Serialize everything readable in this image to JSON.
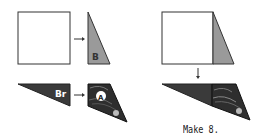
{
  "diagram": {
    "type": "folding-instructions",
    "colors": {
      "outline": "#333333",
      "paper_white": "#ffffff",
      "gray_fill": "#9a9a9a",
      "dark_fill": "#3a3a3a",
      "label_text": "#ffffff"
    },
    "panels": [
      {
        "id": "square-top-left",
        "shape": "square"
      },
      {
        "id": "triangle-b",
        "shape": "right-triangle",
        "label": "B"
      },
      {
        "id": "triangle-br",
        "shape": "wide-triangle",
        "label": "Br"
      },
      {
        "id": "triangle-a",
        "shape": "trapezoid-image",
        "label": "A"
      },
      {
        "id": "square-combined",
        "shape": "square-with-triangle"
      },
      {
        "id": "combined-bottom",
        "shape": "long-triangle-with-image"
      }
    ],
    "labels": {
      "b": "B",
      "br": "Br",
      "a": "A"
    },
    "caption": "Make 8."
  }
}
